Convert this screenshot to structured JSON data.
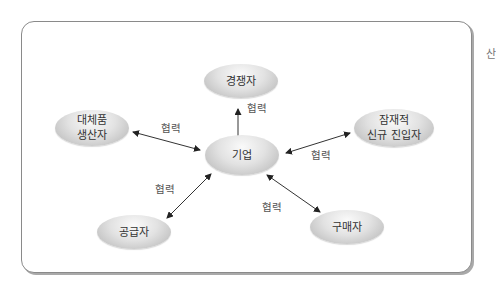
{
  "diagram": {
    "title": "",
    "nodes": {
      "center": {
        "label": "기업"
      },
      "top": {
        "label": "경쟁자"
      },
      "left": {
        "line1": "대체품",
        "line2": "생산자"
      },
      "right": {
        "line1": "잠재적",
        "line2": "신규 진입자"
      },
      "bottom_left": {
        "label": "공급자"
      },
      "bottom_right": {
        "label": "구매자"
      }
    },
    "edges": [
      {
        "from": "top",
        "to": "center",
        "label": "협력"
      },
      {
        "from": "left",
        "to": "center",
        "label": "협력"
      },
      {
        "from": "right",
        "to": "center",
        "label": "협력"
      },
      {
        "from": "bottom_left",
        "to": "center",
        "label": "협력"
      },
      {
        "from": "bottom_right",
        "to": "center",
        "label": "협력"
      }
    ],
    "clipped_text": "산"
  }
}
